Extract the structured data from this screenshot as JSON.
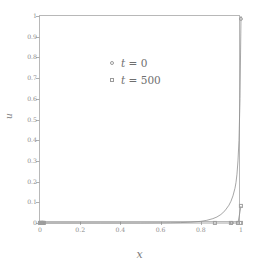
{
  "figure": {
    "background_color": "#ffffff",
    "frame_color": "#b8b8b8",
    "line_color": "#8f8f8f",
    "marker_color": "#9e9e9e",
    "tick_label_color": "#8d8d8d"
  },
  "axes": {
    "xlabel": "x",
    "ylabel": "u",
    "xticks": [
      "0",
      "0.2",
      "0.4",
      "0.6",
      "0.8",
      "1"
    ],
    "xtick_values": [
      0,
      0.2,
      0.4,
      0.6,
      0.8,
      1
    ],
    "yticks": [
      "0",
      "0.1",
      "0.2",
      "0.3",
      "0.4",
      "0.5",
      "0.6",
      "0.7",
      "0.8",
      "0.9",
      "1"
    ],
    "ytick_values": [
      0,
      0.1,
      0.2,
      0.3,
      0.4,
      0.5,
      0.6,
      0.7,
      0.8,
      0.9,
      1
    ]
  },
  "legend": {
    "position": "upper-left",
    "entries": [
      {
        "label_var": "t",
        "label_eq": "= 0",
        "marker": "circle-marker",
        "series": "t0"
      },
      {
        "label_var": "t",
        "label_eq": "= 500",
        "marker": "square-marker",
        "series": "t500"
      }
    ]
  },
  "chart_data": {
    "type": "line",
    "title": "",
    "xlabel": "x",
    "ylabel": "u",
    "xlim": [
      0,
      1
    ],
    "ylim": [
      0,
      1
    ],
    "grid": false,
    "legend_position": "upper-left",
    "series": [
      {
        "name": "t = 0",
        "marker": "circle",
        "has_line": true,
        "x": [
          0.0,
          0.005,
          0.01,
          0.015,
          0.02,
          0.05,
          0.1,
          0.2,
          0.3,
          0.4,
          0.5,
          0.6,
          0.65,
          0.7,
          0.75,
          0.8,
          0.83,
          0.86,
          0.88,
          0.9,
          0.92,
          0.94,
          0.95,
          0.96,
          0.97,
          0.975,
          0.98,
          0.985,
          0.99,
          0.995,
          1.0
        ],
        "y": [
          0.0,
          0.0,
          0.0,
          0.0,
          0.0,
          0.0,
          0.0,
          0.0,
          0.0,
          0.0,
          0.0,
          0.0005,
          0.001,
          0.002,
          0.004,
          0.008,
          0.013,
          0.021,
          0.029,
          0.041,
          0.059,
          0.086,
          0.105,
          0.131,
          0.168,
          0.195,
          0.236,
          0.3,
          0.4,
          0.6,
          1.0
        ]
      },
      {
        "name": "t = 500",
        "marker": "square",
        "has_line": true,
        "x": [
          0.0,
          0.004,
          0.008,
          0.012,
          0.016,
          0.02,
          0.87,
          0.95,
          0.985,
          1.0
        ],
        "y": [
          0.0,
          0.0,
          0.0,
          0.0,
          0.0,
          0.0,
          0.0,
          0.0,
          0.0,
          0.082
        ]
      }
    ],
    "markers_t0": {
      "x": [
        0.0,
        0.004,
        0.008,
        0.012,
        0.016,
        0.02,
        0.955,
        0.985,
        1.0
      ],
      "y": [
        0.0,
        0.0,
        0.0,
        0.0,
        0.0,
        0.0,
        0.0,
        0.0,
        0.985
      ]
    },
    "markers_t500": {
      "x": [
        0.0,
        0.004,
        0.008,
        0.012,
        0.016,
        0.02,
        0.87,
        0.95,
        0.985,
        1.0,
        1.0
      ],
      "y": [
        0.0,
        0.0,
        0.0,
        0.0,
        0.0,
        0.0,
        0.0,
        0.0,
        0.0,
        0.0,
        0.082
      ]
    }
  }
}
